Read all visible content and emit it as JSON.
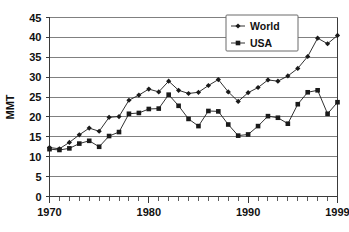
{
  "chart_data": {
    "type": "line",
    "title": "",
    "subtitle": "",
    "xlabel": "",
    "ylabel": "MMT",
    "xlim": [
      1970,
      1999
    ],
    "ylim": [
      0,
      45
    ],
    "ytick_step": 5,
    "yticks": [
      0,
      5,
      10,
      15,
      20,
      25,
      30,
      35,
      40,
      45
    ],
    "xticks_labeled": [
      1970,
      1980,
      1990,
      1999
    ],
    "xtick_minor_step": 1,
    "grid": "horizontal",
    "legend_position": "top-right",
    "x": [
      1970,
      1971,
      1972,
      1973,
      1974,
      1975,
      1976,
      1977,
      1978,
      1979,
      1980,
      1981,
      1982,
      1983,
      1984,
      1985,
      1986,
      1987,
      1988,
      1989,
      1990,
      1991,
      1992,
      1993,
      1994,
      1995,
      1996,
      1997,
      1998,
      1999
    ],
    "series": [
      {
        "name": "World",
        "marker": "diamond",
        "color": "#1a1a1a",
        "values": [
          12.3,
          12.0,
          13.6,
          15.5,
          17.2,
          16.4,
          19.9,
          20.1,
          24.2,
          25.5,
          27.0,
          26.3,
          29.0,
          26.7,
          25.9,
          26.2,
          27.9,
          29.4,
          26.3,
          23.9,
          26.1,
          27.4,
          29.3,
          29.0,
          30.3,
          32.2,
          35.2,
          39.8,
          38.4,
          40.5
        ]
      },
      {
        "name": "USA",
        "marker": "square",
        "color": "#1a1a1a",
        "values": [
          11.9,
          11.7,
          12.1,
          13.3,
          14.0,
          12.5,
          15.2,
          16.2,
          20.8,
          21.0,
          22.0,
          22.1,
          25.6,
          22.8,
          19.5,
          17.7,
          21.5,
          21.4,
          18.1,
          15.3,
          15.6,
          17.7,
          20.2,
          19.8,
          18.3,
          23.2,
          26.2,
          26.7,
          20.8,
          23.7
        ]
      }
    ]
  },
  "axes": {
    "ylabel": "MMT",
    "ytick_labels": [
      "0",
      "5",
      "10",
      "15",
      "20",
      "25",
      "30",
      "35",
      "40",
      "45"
    ],
    "xtick_labels": [
      "1970",
      "1980",
      "1990",
      "1999"
    ]
  },
  "legend": {
    "entries": [
      {
        "label": "World",
        "marker": "diamond-marker"
      },
      {
        "label": "USA",
        "marker": "square-marker"
      }
    ]
  },
  "caption": {
    "text": ""
  }
}
